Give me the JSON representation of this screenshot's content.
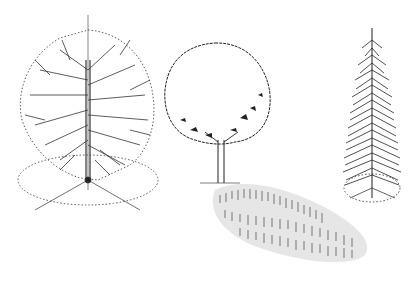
{
  "illustration": {
    "subject": "three tree sketches",
    "style": "pen and ink",
    "background": "#ffffff",
    "ink": "#222222",
    "trees": [
      {
        "name": "deciduous-tree-bare",
        "form": "rounded crown with bare branches, dotted crown outline, ground ellipse with radial lines"
      },
      {
        "name": "round-crown-tree",
        "form": "lollipop crown outline with shaded foliage underside, cast shadow on ground"
      },
      {
        "name": "conifer-tree",
        "form": "narrow conical evergreen with dotted ground ellipse"
      }
    ]
  }
}
